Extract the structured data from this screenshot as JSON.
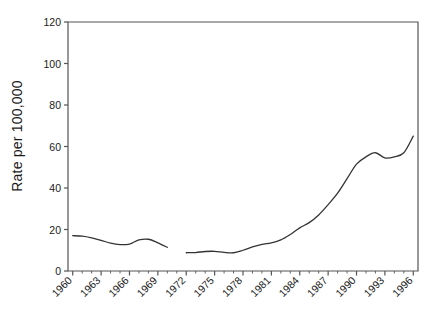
{
  "chart_data": {
    "type": "line",
    "title": "",
    "xlabel": "",
    "ylabel": "Rate per 100,000",
    "xlim": [
      1959.5,
      1996.5
    ],
    "ylim": [
      0,
      120
    ],
    "grid": false,
    "legend": null,
    "y_ticks": [
      0,
      20,
      40,
      60,
      80,
      100,
      120
    ],
    "y_tick_labels": [
      "0",
      "20",
      "40",
      "60",
      "80",
      "100",
      "120"
    ],
    "x_tick_labels": [
      "1960",
      "1963",
      "1966",
      "1969",
      "1972",
      "1975",
      "1978",
      "1981",
      "1984",
      "1987",
      "1990",
      "1993",
      "1996"
    ],
    "x_tick_years": [
      1960,
      1963,
      1966,
      1969,
      1972,
      1975,
      1978,
      1981,
      1984,
      1987,
      1990,
      1993,
      1996
    ],
    "x_minor_years": [
      1961,
      1962,
      1964,
      1965,
      1967,
      1968,
      1970,
      1971,
      1973,
      1974,
      1976,
      1977,
      1979,
      1980,
      1982,
      1983,
      1985,
      1986,
      1988,
      1989,
      1991,
      1992,
      1994,
      1995
    ],
    "line_color": "#333333",
    "axis_color": "#555555",
    "series": [
      {
        "name": "rate",
        "x": [
          1960,
          1961,
          1962,
          1963,
          1964,
          1965,
          1966,
          1967,
          1968,
          1969,
          1970,
          1972,
          1973,
          1974,
          1975,
          1976,
          1977,
          1978,
          1979,
          1980,
          1981,
          1982,
          1983,
          1984,
          1985,
          1986,
          1987,
          1988,
          1989,
          1990,
          1991,
          1992,
          1993,
          1994,
          1995,
          1996
        ],
        "values": [
          17.0,
          16.8,
          16.0,
          14.8,
          13.4,
          12.7,
          13.0,
          15.0,
          15.3,
          13.6,
          11.4,
          8.8,
          8.9,
          9.4,
          9.5,
          9.0,
          8.8,
          10.0,
          11.6,
          12.8,
          13.6,
          15.0,
          17.6,
          20.8,
          23.3,
          27.0,
          32.0,
          37.5,
          44.5,
          51.5,
          55.0,
          57.0,
          54.5,
          55.0,
          57.0,
          65.0
        ],
        "gap_after_year": 1970
      }
    ]
  },
  "figure": {
    "background_color": "#ffffff"
  }
}
